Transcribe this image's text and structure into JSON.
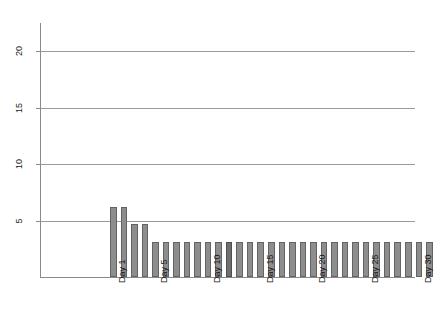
{
  "chart_data": {
    "type": "bar",
    "title": "",
    "subtitle": "",
    "xlabel": "",
    "ylabel": "",
    "grid": true,
    "legend": false,
    "legend_position": "none",
    "ylim": [
      0,
      22.5
    ],
    "yticks": [
      5,
      10,
      15,
      20
    ],
    "ytick_labels": [
      "5",
      "10",
      "15",
      "20"
    ],
    "xtick_positions": [
      1,
      5,
      10,
      15,
      20,
      25,
      30
    ],
    "xtick_labels": [
      "Day 1",
      "Day 5",
      "Day 10",
      "Day 15",
      "Day 20",
      "Day 25",
      "Day 30"
    ],
    "categories": [
      "Day 1",
      "Day 2",
      "Day 3",
      "Day 4",
      "Day 5",
      "Day 6",
      "Day 7",
      "Day 8",
      "Day 9",
      "Day 10",
      "Day 11",
      "Day 12",
      "Day 13",
      "Day 14",
      "Day 15",
      "Day 16",
      "Day 17",
      "Day 18",
      "Day 19",
      "Day 20",
      "Day 21",
      "Day 22",
      "Day 23",
      "Day 24",
      "Day 25",
      "Day 26",
      "Day 27",
      "Day 28",
      "Day 29",
      "Day 30",
      "Day 31"
    ],
    "values": [
      6.2,
      6.2,
      4.7,
      4.7,
      3.1,
      3.1,
      3.1,
      3.1,
      3.1,
      3.1,
      3.1,
      3.1,
      3.1,
      3.1,
      3.1,
      3.1,
      3.1,
      3.1,
      3.1,
      3.1,
      3.1,
      3.1,
      3.1,
      3.1,
      3.1,
      3.1,
      3.1,
      3.1,
      3.1,
      3.1,
      3.1
    ],
    "highlighted_indices": [
      11
    ],
    "bar_color": "#8d8d8d",
    "bar_border_color": "#636363",
    "bar_highlight_color": "#6f6f6f",
    "grid_color": "#9a9a9a",
    "axis_color": "#8a8a8a",
    "background_color": "#ffffff"
  }
}
